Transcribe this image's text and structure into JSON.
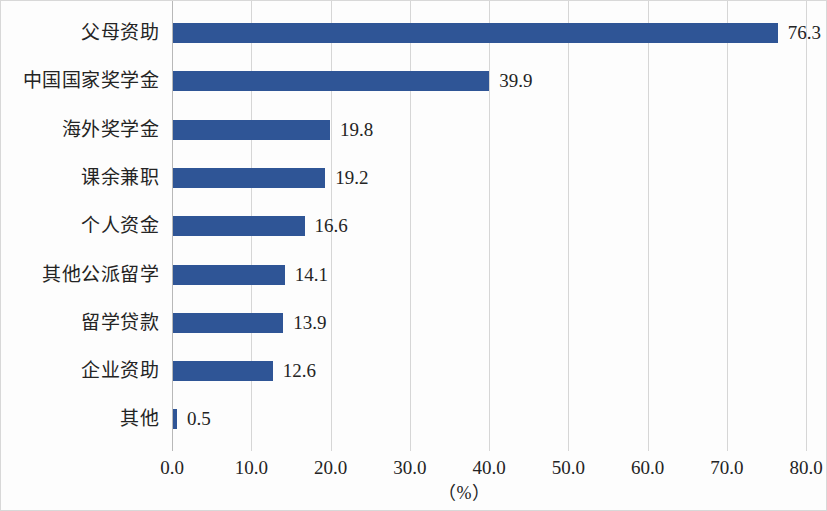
{
  "chart_data": {
    "type": "bar",
    "orientation": "horizontal",
    "title": "",
    "subtitle": "",
    "xlabel": "（%）",
    "ylabel": "",
    "xlim": [
      0.0,
      80.0
    ],
    "xticks": [
      "0.0",
      "10.0",
      "20.0",
      "30.0",
      "40.0",
      "50.0",
      "60.0",
      "70.0",
      "80.0"
    ],
    "xtick_values": [
      0,
      10,
      20,
      30,
      40,
      50,
      60,
      70,
      80
    ],
    "grid": "vertical",
    "legend": "none",
    "bar_color": "#2f5596",
    "gridline_color": "#d6d6d6",
    "categories": [
      "父母资助",
      "中国国家奖学金",
      "海外奖学金",
      "课余兼职",
      "个人资金",
      "其他公派留学",
      "留学贷款",
      "企业资助",
      "其他"
    ],
    "values": [
      76.3,
      39.9,
      19.8,
      19.2,
      16.6,
      14.1,
      13.9,
      12.6,
      0.5
    ],
    "value_labels": [
      "76.3",
      "39.9",
      "19.8",
      "19.2",
      "16.6",
      "14.1",
      "13.9",
      "12.6",
      "0.5"
    ],
    "bars": [
      {
        "category": "父母资助",
        "value": 76.3,
        "label": "76.3"
      },
      {
        "category": "中国国家奖学金",
        "value": 39.9,
        "label": "39.9"
      },
      {
        "category": "海外奖学金",
        "value": 19.8,
        "label": "19.8"
      },
      {
        "category": "课余兼职",
        "value": 19.2,
        "label": "19.2"
      },
      {
        "category": "个人资金",
        "value": 16.6,
        "label": "16.6"
      },
      {
        "category": "其他公派留学",
        "value": 14.1,
        "label": "14.1"
      },
      {
        "category": "留学贷款",
        "value": 13.9,
        "label": "13.9"
      },
      {
        "category": "企业资助",
        "value": 12.6,
        "label": "12.6"
      },
      {
        "category": "其他",
        "value": 0.5,
        "label": "0.5"
      }
    ]
  }
}
